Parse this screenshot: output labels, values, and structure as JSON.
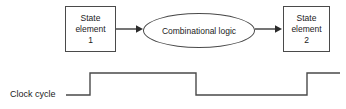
{
  "diagram": {
    "state_element_1": {
      "line1": "State",
      "line2": "element",
      "line3": "1"
    },
    "combinational_logic": {
      "label": "Combinational logic"
    },
    "state_element_2": {
      "line1": "State",
      "line2": "element",
      "line3": "2"
    },
    "clock": {
      "label": "Clock cycle"
    },
    "colors": {
      "stroke": "#4a4a4a",
      "text": "#1b1b1b",
      "background": "#ffffff"
    }
  },
  "chart_data": {
    "type": "line",
    "title": "Clock cycle",
    "xlabel": "",
    "ylabel": "",
    "grid": false,
    "legend": "none",
    "series": [
      {
        "name": "Clock cycle",
        "points": [
          {
            "x": 66,
            "y": 0
          },
          {
            "x": 90,
            "y": 0
          },
          {
            "x": 90,
            "y": 1
          },
          {
            "x": 196,
            "y": 1
          },
          {
            "x": 196,
            "y": 0
          },
          {
            "x": 307,
            "y": 0
          },
          {
            "x": 307,
            "y": 1
          },
          {
            "x": 340,
            "y": 1
          }
        ]
      }
    ],
    "xlim": [
      0,
      346
    ],
    "ylim": [
      0,
      1
    ]
  }
}
